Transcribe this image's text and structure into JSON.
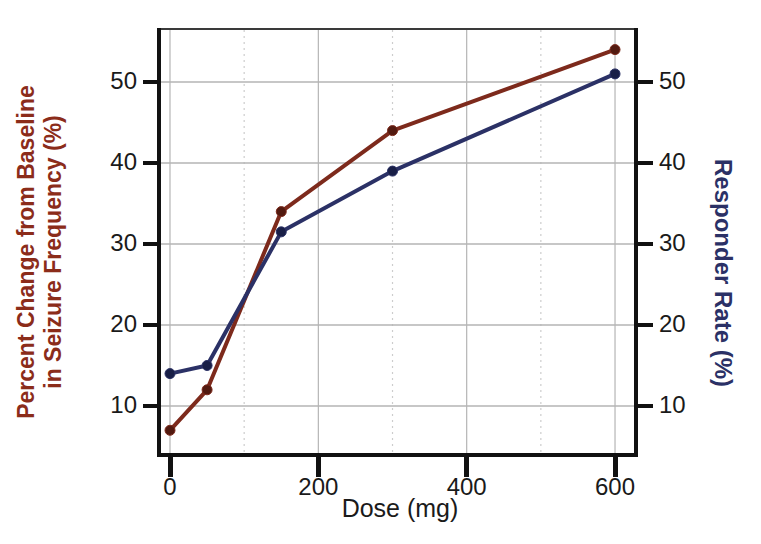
{
  "chart_data": {
    "type": "line",
    "title": "",
    "x_label": "Dose (mg)",
    "x": [
      0,
      50,
      150,
      300,
      600
    ],
    "x_ticks": [
      0,
      200,
      400,
      600
    ],
    "x_minor_gridlines": [
      100,
      300,
      500
    ],
    "x_major_gridlines": [
      0,
      200,
      400,
      600
    ],
    "y_ticks": [
      10,
      20,
      30,
      40,
      50
    ],
    "x_range": [
      -18,
      631
    ],
    "y_range": [
      3.7,
      56.7
    ],
    "grid": true,
    "legend": "none",
    "left_axis": {
      "label_line1": "Percent Change from Baseline",
      "label_line2": "in Seizure Frequency (%)",
      "color": "#8b2c1a"
    },
    "right_axis": {
      "label": "Responder Rate (%)",
      "color": "#2b3166"
    },
    "series": [
      {
        "name": "Percent Change from Baseline in Seizure Frequency (%)",
        "axis": "left",
        "line_color": "#7d2a1c",
        "marker_color": "#521a10",
        "values": [
          7,
          12,
          34,
          44,
          54
        ]
      },
      {
        "name": "Responder Rate (%)",
        "axis": "right",
        "line_color": "#2b3166",
        "marker_color": "#191f47",
        "values": [
          14,
          15,
          31.5,
          39,
          51
        ]
      }
    ],
    "colors": {
      "axis_frame": "#111111",
      "frame_top": "#3a3a3a",
      "tick_label": "#1a1a1a",
      "grid_major": "#b5b5b5",
      "grid_minor": "#cdcdcd",
      "background": "#ffffff"
    }
  }
}
